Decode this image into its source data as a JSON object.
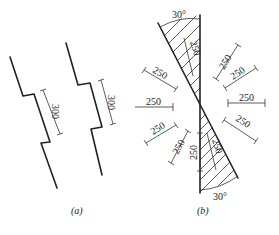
{
  "figure_a": {
    "caption": "(a)",
    "dimension_labels": [
      "300",
      "300"
    ]
  },
  "figure_b": {
    "caption": "(b)",
    "angle_labels": [
      "30°",
      "30°"
    ],
    "dimension_labels": {
      "top_hatch": "250",
      "upper_right_1": "250",
      "upper_right_2": "250",
      "right": "250",
      "lower_right": "250",
      "upper_left": "250",
      "left": "250",
      "lower_left_1": "250",
      "lower_left_2": "250",
      "bottom_vertical": "250",
      "bottom_hatch": "250"
    }
  }
}
